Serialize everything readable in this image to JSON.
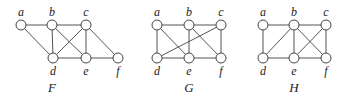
{
  "diagram": {
    "graphs": [
      {
        "name": "F",
        "label_pos": [
          52,
          92
        ],
        "vertices": [
          {
            "id": "a",
            "x": 21,
            "y": 25,
            "label_side": "top"
          },
          {
            "id": "b",
            "x": 52,
            "y": 25,
            "label_side": "top"
          },
          {
            "id": "c",
            "x": 86,
            "y": 25,
            "label_side": "top"
          },
          {
            "id": "d",
            "x": 53,
            "y": 58,
            "label_side": "bottom"
          },
          {
            "id": "e",
            "x": 86,
            "y": 58,
            "label_side": "bottom"
          },
          {
            "id": "f",
            "x": 118,
            "y": 58,
            "label_side": "bottom"
          }
        ],
        "edges": [
          [
            "a",
            "b"
          ],
          [
            "b",
            "c"
          ],
          [
            "a",
            "d"
          ],
          [
            "b",
            "d"
          ],
          [
            "b",
            "e"
          ],
          [
            "c",
            "d"
          ],
          [
            "c",
            "e"
          ],
          [
            "c",
            "f"
          ],
          [
            "d",
            "e"
          ],
          [
            "e",
            "f"
          ]
        ]
      },
      {
        "name": "G",
        "label_pos": [
          189,
          92
        ],
        "vertices": [
          {
            "id": "a",
            "x": 157,
            "y": 25,
            "label_side": "top"
          },
          {
            "id": "b",
            "x": 189,
            "y": 25,
            "label_side": "top"
          },
          {
            "id": "c",
            "x": 221,
            "y": 25,
            "label_side": "top"
          },
          {
            "id": "d",
            "x": 157,
            "y": 58,
            "label_side": "bottom"
          },
          {
            "id": "e",
            "x": 189,
            "y": 58,
            "label_side": "bottom"
          },
          {
            "id": "f",
            "x": 221,
            "y": 58,
            "label_side": "bottom"
          }
        ],
        "edges": [
          [
            "a",
            "b"
          ],
          [
            "b",
            "c"
          ],
          [
            "a",
            "d"
          ],
          [
            "a",
            "e"
          ],
          [
            "b",
            "e"
          ],
          [
            "b",
            "f"
          ],
          [
            "c",
            "d"
          ],
          [
            "c",
            "f"
          ],
          [
            "d",
            "e"
          ],
          [
            "e",
            "f"
          ]
        ]
      },
      {
        "name": "H",
        "label_pos": [
          294,
          92
        ],
        "vertices": [
          {
            "id": "a",
            "x": 263,
            "y": 25,
            "label_side": "top"
          },
          {
            "id": "b",
            "x": 294,
            "y": 25,
            "label_side": "top"
          },
          {
            "id": "c",
            "x": 326,
            "y": 25,
            "label_side": "top"
          },
          {
            "id": "d",
            "x": 263,
            "y": 58,
            "label_side": "bottom"
          },
          {
            "id": "e",
            "x": 294,
            "y": 58,
            "label_side": "bottom"
          },
          {
            "id": "f",
            "x": 326,
            "y": 58,
            "label_side": "bottom"
          }
        ],
        "edges": [
          [
            "a",
            "b"
          ],
          [
            "b",
            "c"
          ],
          [
            "a",
            "d"
          ],
          [
            "b",
            "d"
          ],
          [
            "b",
            "e"
          ],
          [
            "b",
            "f"
          ],
          [
            "c",
            "e"
          ],
          [
            "c",
            "f"
          ],
          [
            "d",
            "e"
          ],
          [
            "e",
            "f"
          ]
        ]
      }
    ],
    "style": {
      "node_radius": 5,
      "edge_color": "#555555",
      "node_stroke": "#444444",
      "node_fill": "#ffffff",
      "text_color": "#222222"
    }
  }
}
